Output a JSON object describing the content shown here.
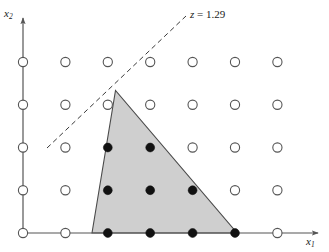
{
  "figure": {
    "axes": {
      "x_axis_label": "x₁",
      "x_axis_label_base": "x",
      "x_axis_label_sub": "1",
      "y_axis_label": "x₂",
      "y_axis_label_base": "x",
      "y_axis_label_sub": "2",
      "axis_color": "#555555"
    },
    "objective_line": {
      "label_text": "z = 1.29",
      "label_var": "z",
      "label_rest": " = 1.29",
      "value": 1.29,
      "style": "dashed",
      "color": "#3a3a3a"
    },
    "feasible_region": {
      "fill_color": "#cfcfcf",
      "edge_color": "#4a4a4a",
      "shape": "triangle"
    },
    "point_styles": {
      "infeasible_label": "open circle",
      "feasible_label": "filled circle",
      "open_fill": "#ffffff",
      "open_stroke": "#555555",
      "filled_fill": "#111111"
    }
  },
  "chart_data": {
    "type": "scatter",
    "title": "",
    "subtitle": "",
    "xlabel": "x₁",
    "ylabel": "x₂",
    "xlim": [
      0,
      6
    ],
    "ylim": [
      0,
      4
    ],
    "grid": false,
    "legend_position": "none",
    "annotations": [
      {
        "text": "z = 1.29",
        "x": 3.9,
        "y": 4.1,
        "kind": "objective-line-label"
      }
    ],
    "lines": [
      {
        "name": "objective-contour",
        "style": "dashed",
        "x": [
          0.6,
          3.8
        ],
        "y": [
          2.05,
          5.1
        ]
      }
    ],
    "polygons": [
      {
        "name": "feasible-region",
        "filled": true,
        "vertices": [
          {
            "x": 1.64,
            "y": 0
          },
          {
            "x": 2.2,
            "y": 3.35
          },
          {
            "x": 5.1,
            "y": 0
          }
        ]
      }
    ],
    "series": [
      {
        "name": "Integer lattice points (infeasible)",
        "marker": "open-circle",
        "points": [
          {
            "x": 0,
            "y": 0
          },
          {
            "x": 1,
            "y": 0
          },
          {
            "x": 6,
            "y": 0
          },
          {
            "x": 0,
            "y": 1
          },
          {
            "x": 1,
            "y": 1
          },
          {
            "x": 5,
            "y": 1
          },
          {
            "x": 6,
            "y": 1
          },
          {
            "x": 0,
            "y": 2
          },
          {
            "x": 1,
            "y": 2
          },
          {
            "x": 4,
            "y": 2
          },
          {
            "x": 5,
            "y": 2
          },
          {
            "x": 6,
            "y": 2
          },
          {
            "x": 0,
            "y": 3
          },
          {
            "x": 1,
            "y": 3
          },
          {
            "x": 2,
            "y": 3
          },
          {
            "x": 3,
            "y": 3
          },
          {
            "x": 4,
            "y": 3
          },
          {
            "x": 5,
            "y": 3
          },
          {
            "x": 6,
            "y": 3
          },
          {
            "x": 0,
            "y": 4
          },
          {
            "x": 1,
            "y": 4
          },
          {
            "x": 2,
            "y": 4
          },
          {
            "x": 3,
            "y": 4
          },
          {
            "x": 4,
            "y": 4
          },
          {
            "x": 5,
            "y": 4
          },
          {
            "x": 6,
            "y": 4
          }
        ]
      },
      {
        "name": "Integer lattice points (feasible)",
        "marker": "filled-circle",
        "points": [
          {
            "x": 2,
            "y": 0
          },
          {
            "x": 3,
            "y": 0
          },
          {
            "x": 4,
            "y": 0
          },
          {
            "x": 5,
            "y": 0
          },
          {
            "x": 2,
            "y": 1
          },
          {
            "x": 3,
            "y": 1
          },
          {
            "x": 4,
            "y": 1
          },
          {
            "x": 2,
            "y": 2
          },
          {
            "x": 3,
            "y": 2
          }
        ]
      }
    ]
  },
  "_pixel_geometry": {
    "origin_px": {
      "x": 23,
      "y": 233
    },
    "col_spacing_px": 42.4,
    "row_spacing_px": 42.75,
    "open_radius_px": 4.6,
    "filled_radius_px": 4.4,
    "triangle_px": [
      {
        "x": 92,
        "y": 233
      },
      {
        "x": 115.5,
        "y": 90.5
      },
      {
        "x": 237,
        "y": 233
      }
    ],
    "dashed_line_px": {
      "x1": 47,
      "y1": 148,
      "x2": 186,
      "y2": 16
    },
    "x_axis_px": {
      "x1": 23,
      "y1": 233,
      "x2": 318,
      "y2": 233
    },
    "y_axis_px": {
      "x1": 23,
      "y1": 233,
      "x2": 23,
      "y2": 18
    }
  }
}
